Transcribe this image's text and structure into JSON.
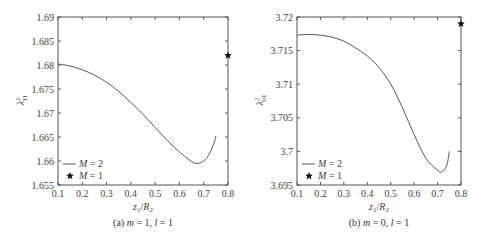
{
  "figure": {
    "panels": [
      {
        "caption_prefix": "(a) ",
        "caption_m": "m",
        "caption_m_val": " = 1, ",
        "caption_l": "l",
        "caption_l_val": " = 1",
        "ylabel_main": "λ",
        "ylabel_sup": "2",
        "ylabel_sub": "11",
        "xlabel_z": "z",
        "xlabel_zsub": "1",
        "xlabel_slash": "/",
        "xlabel_R": "R",
        "xlabel_Rsub": "2",
        "legend": [
          {
            "symbol": "line",
            "label_var": "M",
            "label_val": " = 2"
          },
          {
            "symbol": "star",
            "label_var": "M",
            "label_val": " = 1"
          }
        ]
      },
      {
        "caption_prefix": "(b) ",
        "caption_m": "m",
        "caption_m_val": " = 0, ",
        "caption_l": "l",
        "caption_l_val": " = 1",
        "ylabel_main": "λ",
        "ylabel_sup": "2",
        "ylabel_sub": "01",
        "xlabel_z": "z",
        "xlabel_zsub": "1",
        "xlabel_slash": "/",
        "xlabel_R": "R",
        "xlabel_Rsub": "2",
        "legend": [
          {
            "symbol": "line",
            "label_var": "M",
            "label_val": " = 2"
          },
          {
            "symbol": "star",
            "label_var": "M",
            "label_val": " = 1"
          }
        ]
      }
    ]
  },
  "chart_data": [
    {
      "type": "line",
      "title": "(a) m = 1, l = 1",
      "xlabel": "z1/R2",
      "ylabel": "λ²11",
      "xlim": [
        0.1,
        0.8
      ],
      "ylim": [
        1.655,
        1.69
      ],
      "xticks": [
        "0.1",
        "0.2",
        "0.3",
        "0.4",
        "0.5",
        "0.6",
        "0.7",
        "0.8"
      ],
      "yticks": [
        "1.655",
        "1.66",
        "1.665",
        "1.67",
        "1.675",
        "1.68",
        "1.685",
        "1.69"
      ],
      "grid": false,
      "legend_position": "lower left",
      "series": [
        {
          "name": "M = 2",
          "style": "line",
          "x": [
            0.1,
            0.15,
            0.2,
            0.25,
            0.3,
            0.35,
            0.4,
            0.45,
            0.5,
            0.55,
            0.6,
            0.65,
            0.675,
            0.7,
            0.72,
            0.74,
            0.75
          ],
          "y": [
            1.6802,
            1.6798,
            1.679,
            1.6779,
            1.6764,
            1.6745,
            1.6722,
            1.6697,
            1.667,
            1.6643,
            1.6619,
            1.6599,
            1.6595,
            1.66,
            1.6612,
            1.6634,
            1.6652
          ]
        },
        {
          "name": "M = 1",
          "style": "star",
          "x": [
            0.8
          ],
          "y": [
            1.682
          ]
        }
      ]
    },
    {
      "type": "line",
      "title": "(b) m = 0, l = 1",
      "xlabel": "z1/R2",
      "ylabel": "λ²01",
      "xlim": [
        0.1,
        0.8
      ],
      "ylim": [
        3.695,
        3.72
      ],
      "xticks": [
        "0.1",
        "0.2",
        "0.3",
        "0.4",
        "0.5",
        "0.6",
        "0.7",
        "0.8"
      ],
      "yticks": [
        "3.695",
        "3.7",
        "3.705",
        "3.71",
        "3.715",
        "3.72"
      ],
      "grid": false,
      "legend_position": "lower left",
      "series": [
        {
          "name": "M = 2",
          "style": "line",
          "x": [
            0.1,
            0.15,
            0.2,
            0.25,
            0.3,
            0.35,
            0.4,
            0.45,
            0.5,
            0.55,
            0.6,
            0.65,
            0.7,
            0.72,
            0.74,
            0.75
          ],
          "y": [
            3.7173,
            3.7174,
            3.7173,
            3.717,
            3.7164,
            3.7154,
            3.7142,
            3.7125,
            3.71,
            3.7065,
            3.7025,
            3.699,
            3.6972,
            3.697,
            3.698,
            3.7
          ]
        },
        {
          "name": "M = 1",
          "style": "star",
          "x": [
            0.8
          ],
          "y": [
            3.719
          ]
        }
      ]
    }
  ]
}
